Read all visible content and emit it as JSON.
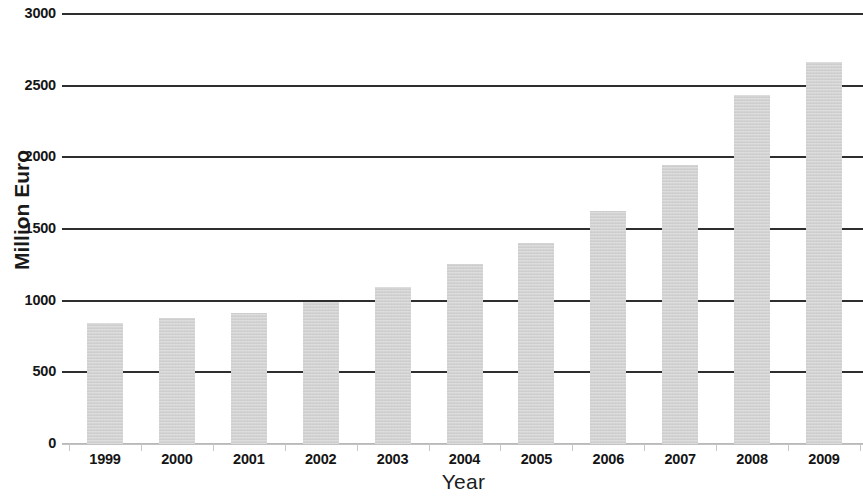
{
  "chart_data": {
    "type": "bar",
    "title": "",
    "xlabel": "Year",
    "ylabel": "Million Euro",
    "categories": [
      "1999",
      "2000",
      "2001",
      "2002",
      "2003",
      "2004",
      "2005",
      "2006",
      "2007",
      "2008",
      "2009"
    ],
    "values": [
      845,
      880,
      915,
      990,
      1095,
      1255,
      1405,
      1625,
      1945,
      2435,
      2665
    ],
    "series": [
      {
        "name": "Million Euro",
        "values": [
          845,
          880,
          915,
          990,
          1095,
          1255,
          1405,
          1625,
          1945,
          2435,
          2665
        ]
      }
    ],
    "ylim": [
      0,
      3000
    ],
    "y_ticks": [
      "0",
      "500",
      "1000",
      "1500",
      "2000",
      "2500",
      "3000"
    ],
    "y_tick_values": [
      0,
      500,
      1000,
      1500,
      2000,
      2500,
      3000
    ],
    "grid": "horizontal",
    "legend": "none",
    "bar_color": "#d2d2d2",
    "gridline_color": "#2e2e2e",
    "text_color": "#141414",
    "background": "#ffffff"
  }
}
